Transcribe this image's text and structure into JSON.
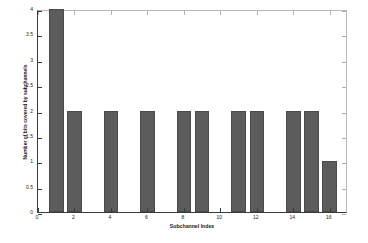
{
  "chart_data": {
    "type": "bar",
    "title": "",
    "xlabel": "Subchannel Index",
    "ylabel": "Number of bits covered by subchannels",
    "x": [
      1,
      2,
      4,
      6,
      8,
      9,
      11,
      12,
      14,
      15,
      16
    ],
    "values": [
      4,
      2,
      2,
      2,
      2,
      2,
      2,
      2,
      2,
      2,
      1
    ],
    "xlim": [
      0,
      17
    ],
    "ylim": [
      0,
      4
    ],
    "xticks": [
      0,
      2,
      4,
      6,
      8,
      10,
      12,
      14,
      16
    ],
    "xtick_labels": [
      "0",
      "2",
      "4",
      "6",
      "8",
      "10",
      "12",
      "14",
      "16"
    ],
    "yticks": [
      0,
      0.5,
      1,
      1.5,
      2,
      2.5,
      3,
      3.5,
      4
    ],
    "ytick_labels": [
      "0",
      "0.5",
      "1",
      "1.5",
      "2",
      "2.5",
      "3",
      "3.5",
      "4"
    ],
    "grid": false,
    "legend": null,
    "bar_color": "#5c5c5c",
    "axis_color": "#3a3a3a",
    "background": "#ffffff"
  }
}
